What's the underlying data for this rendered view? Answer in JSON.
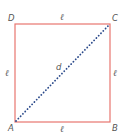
{
  "figure": {
    "type": "square-with-diagonal",
    "colors": {
      "square_stroke": "#e8766f",
      "diagonal_dots": "#2b4a8b",
      "label_text": "#555555",
      "background": "#ffffff"
    },
    "vertices": {
      "A": {
        "label": "A",
        "x": 15,
        "y": 122
      },
      "B": {
        "label": "B",
        "x": 110,
        "y": 122
      },
      "C": {
        "label": "C",
        "x": 110,
        "y": 24
      },
      "D": {
        "label": "D",
        "x": 15,
        "y": 24
      }
    },
    "sides": {
      "top": {
        "label": "ℓ"
      },
      "bottom": {
        "label": "ℓ"
      },
      "left": {
        "label": "ℓ"
      },
      "right": {
        "label": "ℓ"
      }
    },
    "diagonal": {
      "from": "A",
      "to": "C",
      "label": "d",
      "style": "dotted"
    }
  }
}
